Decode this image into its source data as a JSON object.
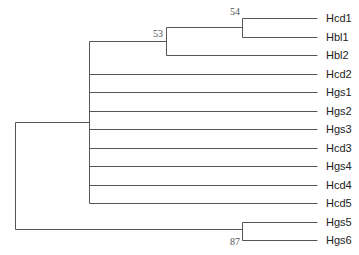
{
  "tree": {
    "leaves": [
      {
        "label": "Hcd1",
        "y": 18
      },
      {
        "label": "Hbl1",
        "y": 37
      },
      {
        "label": "Hbl2",
        "y": 55
      },
      {
        "label": "Hcd2",
        "y": 74
      },
      {
        "label": "Hgs1",
        "y": 92
      },
      {
        "label": "Hgs2",
        "y": 111
      },
      {
        "label": "Hgs3",
        "y": 129
      },
      {
        "label": "Hcd3",
        "y": 148
      },
      {
        "label": "Hgs4",
        "y": 166
      },
      {
        "label": "Hcd4",
        "y": 185
      },
      {
        "label": "Hcd5",
        "y": 203
      },
      {
        "label": "Hgs5",
        "y": 222
      },
      {
        "label": "Hgs6",
        "y": 240
      }
    ],
    "support_values": [
      {
        "value": "53",
        "x": 163,
        "y": 37
      },
      {
        "value": "54",
        "x": 240,
        "y": 15
      },
      {
        "value": "87",
        "x": 240,
        "y": 245
      }
    ],
    "leaf_end_x": 317,
    "label_x": 326,
    "branches": [
      {
        "x1": 15,
        "y1": 122,
        "x2": 15,
        "y2": 229
      },
      {
        "x1": 15,
        "y1": 122,
        "x2": 89,
        "y2": 122
      },
      {
        "x1": 15,
        "y1": 229,
        "x2": 242,
        "y2": 229
      },
      {
        "x1": 89,
        "y1": 41,
        "x2": 89,
        "y2": 203
      },
      {
        "x1": 89,
        "y1": 41,
        "x2": 166,
        "y2": 41
      },
      {
        "x1": 166,
        "y1": 27,
        "x2": 166,
        "y2": 55
      },
      {
        "x1": 166,
        "y1": 27,
        "x2": 242,
        "y2": 27
      },
      {
        "x1": 242,
        "y1": 18,
        "x2": 242,
        "y2": 37
      },
      {
        "x1": 242,
        "y1": 18,
        "x2": 317,
        "y2": 18
      },
      {
        "x1": 242,
        "y1": 37,
        "x2": 317,
        "y2": 37
      },
      {
        "x1": 166,
        "y1": 55,
        "x2": 317,
        "y2": 55
      },
      {
        "x1": 89,
        "y1": 74,
        "x2": 317,
        "y2": 74
      },
      {
        "x1": 89,
        "y1": 92,
        "x2": 317,
        "y2": 92
      },
      {
        "x1": 89,
        "y1": 111,
        "x2": 317,
        "y2": 111
      },
      {
        "x1": 89,
        "y1": 129,
        "x2": 317,
        "y2": 129
      },
      {
        "x1": 89,
        "y1": 148,
        "x2": 317,
        "y2": 148
      },
      {
        "x1": 89,
        "y1": 166,
        "x2": 317,
        "y2": 166
      },
      {
        "x1": 89,
        "y1": 185,
        "x2": 317,
        "y2": 185
      },
      {
        "x1": 89,
        "y1": 203,
        "x2": 317,
        "y2": 203
      },
      {
        "x1": 242,
        "y1": 222,
        "x2": 242,
        "y2": 240
      },
      {
        "x1": 242,
        "y1": 222,
        "x2": 317,
        "y2": 222
      },
      {
        "x1": 242,
        "y1": 240,
        "x2": 317,
        "y2": 240
      }
    ]
  }
}
